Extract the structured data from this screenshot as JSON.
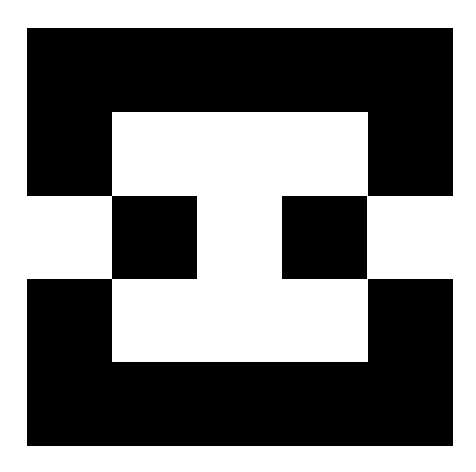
{
  "canvas": {
    "width": 476,
    "height": 472,
    "background_color": "#ffffff",
    "title": "Black and White Geometric Composition"
  },
  "artwork": {
    "name": "abstract-geometric-figure",
    "description": "Abstract black-and-white hard-edge geometric composition",
    "ink_color": "#000000",
    "paper_color": "#ffffff",
    "bounds": {
      "left": 27,
      "top": 28,
      "right": 453,
      "bottom": 446,
      "width": 426,
      "height": 418
    },
    "shapes": [
      {
        "name": "top-black-bar",
        "role": "upper horizontal band",
        "color": "#000000",
        "x": 27,
        "y": 28,
        "width": 426,
        "height": 84
      },
      {
        "name": "upper-left-black-block",
        "role": "left vertical arm upper",
        "color": "#000000",
        "x": 27,
        "y": 112,
        "width": 85,
        "height": 84
      },
      {
        "name": "upper-right-black-block",
        "role": "right vertical arm upper",
        "color": "#000000",
        "x": 368,
        "y": 112,
        "width": 85,
        "height": 84
      },
      {
        "name": "middle-left-black-square",
        "role": "inner left square in middle band",
        "color": "#000000",
        "x": 112,
        "y": 196,
        "width": 85,
        "height": 83
      },
      {
        "name": "middle-right-black-square",
        "role": "inner right square in middle band",
        "color": "#000000",
        "x": 282,
        "y": 196,
        "width": 85,
        "height": 83
      },
      {
        "name": "lower-left-black-block",
        "role": "left vertical arm lower",
        "color": "#000000",
        "x": 27,
        "y": 279,
        "width": 85,
        "height": 83
      },
      {
        "name": "lower-right-black-block",
        "role": "right vertical arm lower",
        "color": "#000000",
        "x": 368,
        "y": 279,
        "width": 85,
        "height": 83
      },
      {
        "name": "bottom-black-bar",
        "role": "lower horizontal band",
        "color": "#000000",
        "x": 27,
        "y": 362,
        "width": 426,
        "height": 84
      }
    ],
    "negative_spaces": [
      {
        "name": "upper-white-notch",
        "color": "#ffffff",
        "x": 112,
        "y": 112,
        "width": 256,
        "height": 84
      },
      {
        "name": "middle-left-white-gap",
        "color": "#ffffff",
        "x": 27,
        "y": 196,
        "width": 85,
        "height": 83
      },
      {
        "name": "middle-center-white-gap",
        "color": "#ffffff",
        "x": 197,
        "y": 196,
        "width": 85,
        "height": 83
      },
      {
        "name": "middle-right-white-gap",
        "color": "#ffffff",
        "x": 367,
        "y": 196,
        "width": 86,
        "height": 83
      },
      {
        "name": "lower-white-notch",
        "color": "#ffffff",
        "x": 112,
        "y": 279,
        "width": 256,
        "height": 83
      }
    ]
  }
}
